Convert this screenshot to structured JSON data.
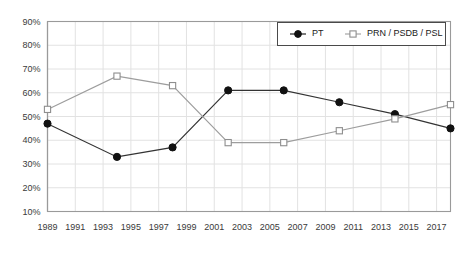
{
  "chart_data": {
    "type": "line",
    "title": "",
    "xlabel": "",
    "ylabel": "",
    "x": [
      1989,
      1994,
      1998,
      2002,
      2006,
      2010,
      2014,
      2018
    ],
    "xlim": [
      1989,
      2018
    ],
    "ylim": [
      10,
      90
    ],
    "grid": true,
    "legend_position": "top-right",
    "y_ticks": [
      "10%",
      "20%",
      "30%",
      "40%",
      "50%",
      "60%",
      "70%",
      "80%",
      "90%"
    ],
    "y_tick_values": [
      10,
      20,
      30,
      40,
      50,
      60,
      70,
      80,
      90
    ],
    "x_ticks": [
      "1989",
      "1991",
      "1993",
      "1995",
      "1997",
      "1999",
      "2001",
      "2003",
      "2005",
      "2007",
      "2009",
      "2011",
      "2013",
      "2015",
      "2017"
    ],
    "x_tick_values": [
      1989,
      1991,
      1993,
      1995,
      1997,
      1999,
      2001,
      2003,
      2005,
      2007,
      2009,
      2011,
      2013,
      2015,
      2017
    ],
    "series": [
      {
        "name": "PT",
        "marker": "filled-circle",
        "color": "#111111",
        "line_style": "solid",
        "values": [
          47,
          33,
          37,
          61,
          61,
          56,
          51,
          45
        ]
      },
      {
        "name": "PRN / PSDB / PSL",
        "marker": "open-square",
        "color": "#9d9d9d",
        "line_style": "solid",
        "values": [
          53,
          67,
          63,
          39,
          39,
          44,
          49,
          55
        ]
      }
    ]
  },
  "legend": {
    "entries": [
      {
        "label": "PT"
      },
      {
        "label": "PRN / PSDB / PSL"
      }
    ]
  },
  "colors": {
    "series_pt": "#111111",
    "series_opp": "#9d9d9d",
    "grid": "#e2e2e2",
    "axis": "#9a9a9a",
    "background": "#ffffff"
  }
}
